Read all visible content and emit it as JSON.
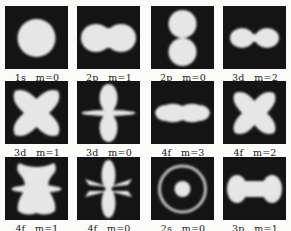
{
  "figure": {
    "orbitals": [
      {
        "label": "1s   m=0",
        "shape": "sphere"
      },
      {
        "label": "2p   m=1",
        "shape": "peanut-horizontal"
      },
      {
        "label": "2p   m=0",
        "shape": "two-lobes-vertical"
      },
      {
        "label": "3d   m=2",
        "shape": "dumbbell-horizontal"
      },
      {
        "label": "3d   m=1",
        "shape": "butterfly"
      },
      {
        "label": "3d   m=0",
        "shape": "dz2-lobes-with-ring"
      },
      {
        "label": "4f   m=3",
        "shape": "wavy-horizontal"
      },
      {
        "label": "4f   m=2",
        "shape": "four-lobed-x"
      },
      {
        "label": "4f   m=1",
        "shape": "six-lobed-figure"
      },
      {
        "label": "4f   m=0",
        "shape": "vertical-lobes-with-cones"
      },
      {
        "label": "2s   m=0",
        "shape": "sphere-with-ring"
      },
      {
        "label": "3p   m=1",
        "shape": "bone-horizontal"
      }
    ]
  }
}
